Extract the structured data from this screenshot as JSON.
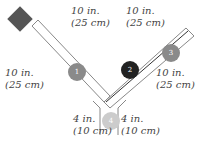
{
  "diagram": {
    "colors": {
      "diamond": "#555555",
      "circle_1": "#8a8a8a",
      "circle_2": "#222222",
      "circle_3": "#8a8a8a",
      "circle_4": "#cccccc",
      "duct_outline": "#888888",
      "inner_line": "#333333",
      "text": "#444444"
    },
    "circles": [
      {
        "id": "1",
        "label": "1"
      },
      {
        "id": "2",
        "label": "2"
      },
      {
        "id": "3",
        "label": "3"
      },
      {
        "id": "4",
        "label": "4"
      }
    ],
    "labels": [
      {
        "line1": "10 in.",
        "line2": "(25 cm)"
      },
      {
        "line1": "10 in.",
        "line2": "(25 cm)"
      },
      {
        "line1": "10 in.",
        "line2": "(25 cm)"
      },
      {
        "line1": "10 in.",
        "line2": "(25 cm)"
      },
      {
        "line1": "4 in.",
        "line2": "(10 cm)"
      },
      {
        "line1": "4 in.",
        "line2": "(10 cm)"
      }
    ]
  }
}
